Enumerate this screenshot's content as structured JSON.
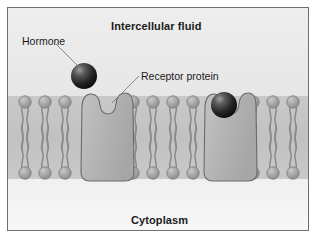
{
  "figure": {
    "kind": "biology-diagram"
  },
  "labels": {
    "top_region": "Intercellular fluid",
    "bottom_region": "Cytoplasm",
    "hormone": "Hormone",
    "receptor": "Receptor protein"
  },
  "colors": {
    "background_top": "#efefef",
    "background_bottom": "#f2f2f2",
    "membrane_band": "#c4c4c4",
    "lipid_head": "#a8a8a8",
    "lipid_head_edge": "#7d7d7d",
    "lipid_tail": "#8a8a8a",
    "receptor_fill": "#b6b6b6",
    "receptor_edge": "#6a6a6a",
    "hormone_fill": "#2a2a2a",
    "hormone_highlight": "#b9b9b9",
    "frame_border": "#6e6e6e",
    "text": "#1b1b1b",
    "leader_line": "#7a7a7a"
  },
  "membrane": {
    "top_y": 88,
    "bottom_y": 171,
    "midline_y": 130,
    "lipid_head_radius": 6.2,
    "lipid_spacing": 20,
    "groups": [
      {
        "name": "left-lipids",
        "count": 3,
        "start_x": 17
      },
      {
        "name": "middle-lipids",
        "count": 4,
        "start_x": 125
      },
      {
        "name": "right-lipids",
        "count": 3,
        "start_x": 245
      }
    ]
  },
  "receptors": [
    {
      "id": "receptor-unbound",
      "label": "Receptor protein",
      "bound": false,
      "center_x": 92
    },
    {
      "id": "receptor-bound",
      "label": "Receptor protein with bound hormone",
      "bound": true,
      "center_x": 215
    }
  ],
  "hormones": [
    {
      "id": "hormone-free",
      "state": "free",
      "cx": 76,
      "cy": 68,
      "r": 13
    },
    {
      "id": "hormone-bound",
      "state": "bound",
      "cx": 216,
      "cy": 97,
      "r": 13
    }
  ],
  "leaders": [
    {
      "id": "leader-hormone",
      "x1": 48,
      "y1": 36,
      "x2": 70,
      "y2": 58
    },
    {
      "id": "leader-receptor",
      "x1": 131,
      "y1": 68,
      "x2": 104,
      "y2": 95
    }
  ]
}
